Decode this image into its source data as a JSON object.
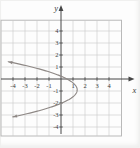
{
  "figure": {
    "background": "#fdfdfd",
    "grid_color": "#c9c9c9",
    "box_color": "#b2b2b2",
    "axis_color": "#474747",
    "curve_color": "#8e8885",
    "label_color": "#3c3c3c"
  },
  "chart_data": {
    "type": "line",
    "xlabel": "x",
    "ylabel": "y",
    "xlim": [
      -5,
      5
    ],
    "ylim": [
      -4.75,
      4.9
    ],
    "grid": true,
    "legend": false,
    "x_tick_values": [
      -4,
      -3,
      -2,
      -1,
      1,
      2,
      3,
      4
    ],
    "x_tick_labels": [
      "-4",
      "-3",
      "-2",
      "-1",
      "1",
      "2",
      "3",
      "4"
    ],
    "y_tick_values": [
      4,
      3,
      2,
      1,
      -1,
      -2,
      -3,
      -4
    ],
    "y_tick_labels": [
      "4",
      "3",
      "2",
      "1",
      "-1",
      "-2",
      "-3",
      "-4"
    ],
    "curve": {
      "shape": "parabola-opening-left",
      "equation_estimate": "x = 1.35 - 1.05(y + 0.9)^2",
      "vertex": [
        1.35,
        -0.9
      ],
      "coefficient": -1.05,
      "y_domain": [
        -3.18,
        1.44
      ],
      "end_arrows": true,
      "points": [
        [
          -4.4,
          1.44
        ],
        [
          -2.44,
          1.0
        ],
        [
          0.5,
          0.0
        ],
        [
          1.35,
          -0.9
        ],
        [
          0.08,
          -2.0
        ],
        [
          -3.28,
          -3.0
        ],
        [
          -4.11,
          -3.18
        ]
      ]
    }
  }
}
